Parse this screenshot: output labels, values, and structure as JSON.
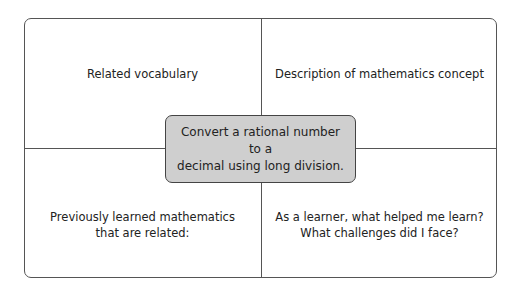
{
  "frayer_model": {
    "top_left": "Related vocabulary",
    "top_right": "Description of mathematics concept",
    "bottom_left_line1": "Previously learned mathematics",
    "bottom_left_line2": "that are related:",
    "bottom_right_line1": "As a learner, what helped me learn?",
    "bottom_right_line2": "What challenges did I face?",
    "center_line1": "Convert a rational number to a",
    "center_line2": "decimal using long division."
  },
  "colors": {
    "border": "#555555",
    "center_fill": "#cfcfcf"
  }
}
